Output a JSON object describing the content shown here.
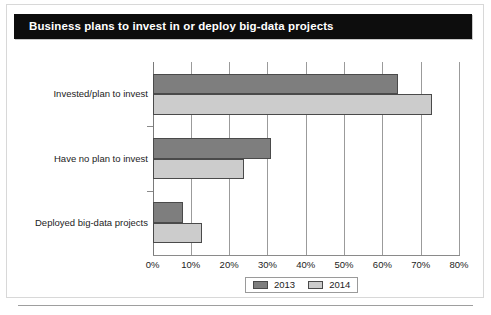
{
  "figure": {
    "title": "Business plans to invest in or deploy big-data projects",
    "title_bar_color": "#0d0d0d",
    "title_text_color": "#ffffff",
    "background_color": "#ffffff",
    "frame_color": "#d8d8d8",
    "bottom_rule_color": "#9e9e9e"
  },
  "legend": {
    "position": "bottom-center",
    "items": [
      {
        "label": "2013",
        "color": "#7e7e7e"
      },
      {
        "label": "2014",
        "color": "#cccccc"
      }
    ]
  },
  "chart_data": {
    "type": "bar",
    "orientation": "horizontal",
    "title": "Business plans to invest in or deploy big-data projects",
    "xlabel": "",
    "ylabel": "",
    "categories": [
      "Invested/plan to invest",
      "Have no plan to invest",
      "Deployed big-data projects"
    ],
    "series": [
      {
        "name": "2013",
        "color": "#7e7e7e",
        "values": [
          64,
          31,
          8
        ]
      },
      {
        "name": "2014",
        "color": "#cccccc",
        "values": [
          73,
          24,
          13
        ]
      }
    ],
    "xlim": [
      0,
      80
    ],
    "xticks": [
      0,
      10,
      20,
      30,
      40,
      50,
      60,
      70,
      80
    ],
    "xtick_labels": [
      "0%",
      "10%",
      "20%",
      "30%",
      "40%",
      "50%",
      "60%",
      "70%",
      "80%"
    ],
    "value_unit": "%",
    "grid": "vertical",
    "legend_position": "bottom-center"
  }
}
